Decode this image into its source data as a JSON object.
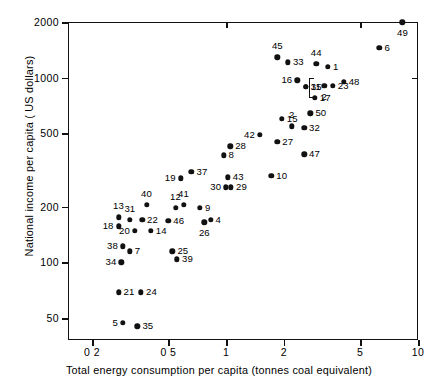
{
  "chart_data": {
    "type": "scatter",
    "title": "",
    "xlabel": "Total energy consumption per capita (tonnes coal equivalent)",
    "ylabel": "National income per capita ( US dollars)",
    "xscale": "log",
    "yscale": "log",
    "xlim": [
      0.15,
      10
    ],
    "ylim": [
      38,
      2000
    ],
    "grid": false,
    "legend": "none",
    "xticks": [
      {
        "value": 0.2,
        "label": "0 2"
      },
      {
        "value": 0.5,
        "label": "0 5"
      },
      {
        "value": 1,
        "label": "1"
      },
      {
        "value": 2,
        "label": "2"
      },
      {
        "value": 5,
        "label": "5"
      },
      {
        "value": 10,
        "label": "10"
      }
    ],
    "yticks": [
      {
        "value": 2000,
        "label": "2000"
      },
      {
        "value": 1000,
        "label": "1000"
      },
      {
        "value": 500,
        "label": "500"
      },
      {
        "value": 200,
        "label": "200"
      },
      {
        "value": 100,
        "label": "100"
      },
      {
        "value": 50,
        "label": "50"
      }
    ],
    "points": [
      {
        "label": "49",
        "x": 8.3,
        "y": 1990,
        "pos": "b"
      },
      {
        "label": "6",
        "x": 6.3,
        "y": 1450,
        "pos": "r"
      },
      {
        "label": "45",
        "x": 1.85,
        "y": 1290,
        "pos": "t"
      },
      {
        "label": "33",
        "x": 2.1,
        "y": 1210,
        "pos": "r"
      },
      {
        "label": "44",
        "x": 2.95,
        "y": 1190,
        "pos": "t"
      },
      {
        "label": "1",
        "x": 3.4,
        "y": 1140,
        "pos": "r"
      },
      {
        "label": "16",
        "x": 2.35,
        "y": 965,
        "pos": "l"
      },
      {
        "label": "11",
        "x": 2.6,
        "y": 890,
        "pos": "r"
      },
      {
        "label": "35",
        "x": 2.6,
        "y": 890,
        "pos": "r"
      },
      {
        "label": "48",
        "x": 4.1,
        "y": 950,
        "pos": "r"
      },
      {
        "label": "2",
        "x": 3.25,
        "y": 905,
        "pos": "b"
      },
      {
        "label": "23",
        "x": 3.6,
        "y": 900,
        "pos": "r"
      },
      {
        "label": "17",
        "x": 2.9,
        "y": 780,
        "pos": "r"
      },
      {
        "label": "50",
        "x": 2.75,
        "y": 640,
        "pos": "r"
      },
      {
        "label": "15",
        "x": 1.95,
        "y": 600,
        "pos": "r"
      },
      {
        "label": "2",
        "x": 2.2,
        "y": 545,
        "pos": "t"
      },
      {
        "label": "32",
        "x": 2.55,
        "y": 535,
        "pos": "r"
      },
      {
        "label": "42",
        "x": 1.5,
        "y": 492,
        "pos": "l"
      },
      {
        "label": "27",
        "x": 1.85,
        "y": 448,
        "pos": "r"
      },
      {
        "label": "28",
        "x": 1.05,
        "y": 425,
        "pos": "r"
      },
      {
        "label": "47",
        "x": 2.55,
        "y": 385,
        "pos": "r"
      },
      {
        "label": "8",
        "x": 0.97,
        "y": 380,
        "pos": "r"
      },
      {
        "label": "37",
        "x": 0.66,
        "y": 310,
        "pos": "r"
      },
      {
        "label": "10",
        "x": 1.72,
        "y": 295,
        "pos": "r"
      },
      {
        "label": "43",
        "x": 1.02,
        "y": 288,
        "pos": "r"
      },
      {
        "label": "19",
        "x": 0.58,
        "y": 285,
        "pos": "l"
      },
      {
        "label": "30",
        "x": 1.0,
        "y": 255,
        "pos": "l"
      },
      {
        "label": "29",
        "x": 1.06,
        "y": 255,
        "pos": "r"
      },
      {
        "label": "40",
        "x": 0.385,
        "y": 205,
        "pos": "t"
      },
      {
        "label": "41",
        "x": 0.6,
        "y": 205,
        "pos": "t"
      },
      {
        "label": "12",
        "x": 0.545,
        "y": 198,
        "pos": "t"
      },
      {
        "label": "9",
        "x": 0.73,
        "y": 197,
        "pos": "r"
      },
      {
        "label": "13",
        "x": 0.275,
        "y": 175,
        "pos": "t"
      },
      {
        "label": "31",
        "x": 0.315,
        "y": 170,
        "pos": "t"
      },
      {
        "label": "22",
        "x": 0.365,
        "y": 170,
        "pos": "r"
      },
      {
        "label": "46",
        "x": 0.5,
        "y": 168,
        "pos": "r"
      },
      {
        "label": "4",
        "x": 0.83,
        "y": 170,
        "pos": "r"
      },
      {
        "label": "18",
        "x": 0.275,
        "y": 157,
        "pos": "l"
      },
      {
        "label": "26",
        "x": 0.77,
        "y": 165,
        "pos": "b"
      },
      {
        "label": "20",
        "x": 0.335,
        "y": 148,
        "pos": "l"
      },
      {
        "label": "14",
        "x": 0.405,
        "y": 148,
        "pos": "r"
      },
      {
        "label": "38",
        "x": 0.29,
        "y": 122,
        "pos": "l"
      },
      {
        "label": "7",
        "x": 0.315,
        "y": 115,
        "pos": "r"
      },
      {
        "label": "25",
        "x": 0.525,
        "y": 115,
        "pos": "r"
      },
      {
        "label": "39",
        "x": 0.555,
        "y": 104,
        "pos": "r"
      },
      {
        "label": "34",
        "x": 0.285,
        "y": 100,
        "pos": "l"
      },
      {
        "label": "21",
        "x": 0.275,
        "y": 69,
        "pos": "r"
      },
      {
        "label": "24",
        "x": 0.36,
        "y": 69,
        "pos": "r"
      },
      {
        "label": "5",
        "x": 0.29,
        "y": 47,
        "pos": "l"
      },
      {
        "label": "35",
        "x": 0.345,
        "y": 45,
        "pos": "r"
      }
    ]
  }
}
